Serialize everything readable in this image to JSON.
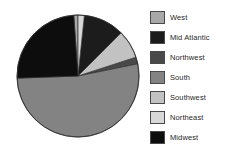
{
  "chart_data": {
    "type": "pie",
    "title": "",
    "subtitle": "",
    "xlabel": "",
    "ylabel": "",
    "grid": false,
    "legend_position": "right",
    "start_angle_deg": 0,
    "direction": "clockwise",
    "center": {
      "cx": 78,
      "cy": 76,
      "r": 61
    },
    "categories": [
      "West",
      "Mid Atlantic",
      "Northwest",
      "South",
      "Southwest",
      "Northeast",
      "Midwest"
    ],
    "values": [
      1.2,
      10.8,
      1.8,
      52.8,
      7.5,
      1.7,
      24.2
    ],
    "slices": [
      {
        "label": "West",
        "value": 1.2,
        "start_deg": 356.0,
        "end_deg": 360.0,
        "color": "#a8a8a8"
      },
      {
        "label": "Mid Atlantic",
        "value": 10.8,
        "start_deg": 6.0,
        "end_deg": 45.0,
        "color": "#1c1c1c"
      },
      {
        "label": "Northwest",
        "value": 1.8,
        "start_deg": 72.0,
        "end_deg": 78.5,
        "color": "#494949"
      },
      {
        "label": "South",
        "value": 52.8,
        "start_deg": 78.5,
        "end_deg": 268.0,
        "color": "#838383"
      },
      {
        "label": "Southwest",
        "value": 7.5,
        "start_deg": 45.0,
        "end_deg": 72.0,
        "color": "#c2c2c2"
      },
      {
        "label": "Northeast",
        "value": 1.7,
        "start_deg": 0.0,
        "end_deg": 6.0,
        "color": "#d8d8d8"
      },
      {
        "label": "Midwest",
        "value": 24.2,
        "start_deg": 268.0,
        "end_deg": 356.0,
        "color": "#0d0d0d"
      }
    ]
  },
  "legend": {
    "items": [
      {
        "label": "West",
        "color": "#a8a8a8",
        "y": 10
      },
      {
        "label": "Mid Atlantic",
        "color": "#1c1c1c",
        "y": 30
      },
      {
        "label": "Northwest",
        "color": "#494949",
        "y": 50
      },
      {
        "label": "South",
        "color": "#838383",
        "y": 70
      },
      {
        "label": "Southwest",
        "color": "#c2c2c2",
        "y": 90
      },
      {
        "label": "Northeast",
        "color": "#d8d8d8",
        "y": 110
      },
      {
        "label": "Midwest",
        "color": "#0d0d0d",
        "y": 130
      }
    ]
  },
  "colors": {
    "background": "#ffffff",
    "slice_outline": "#2e2e2e",
    "legend_border": "#4a4a4a",
    "text": "#1f1f1f"
  }
}
